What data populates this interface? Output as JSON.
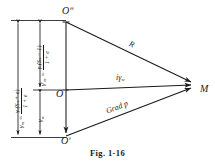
{
  "figure": {
    "caption": "Fig. 1-16",
    "type": "vector-force-diagram"
  },
  "points": [
    {
      "name": "O-double-prime",
      "label": "Oʺ",
      "x": 66,
      "y": 22
    },
    {
      "name": "O-origin",
      "label": "O",
      "x": 66,
      "y": 90
    },
    {
      "name": "O-prime",
      "label": "Oʹ",
      "x": 66,
      "y": 136
    },
    {
      "name": "M-point",
      "label": "M",
      "x": 197,
      "y": 85
    }
  ],
  "vectors": [
    {
      "name": "R-vector",
      "label": "R",
      "from": "Oʺ",
      "to": "M"
    },
    {
      "name": "igw-vector",
      "label": "iγ",
      "sub": "w",
      "from": "O",
      "to": "M"
    },
    {
      "name": "gradp-vector",
      "label": "Grad p",
      "from": "Oʹ",
      "to": "M"
    }
  ],
  "dimensions": [
    {
      "name": "gamma-m-dimension",
      "lhs": "γ",
      "lhs_sub": "m",
      "equals": "=",
      "numerator": "γₐ(Sₛ + e)",
      "denominator": "1 + e",
      "numerator_plain": "γw(Ss + e)",
      "denominator_plain": "1 + e",
      "spans": "Oʺ to Oʹ"
    },
    {
      "name": "gamma-m-prime-dimension",
      "lhs": "γʹ",
      "lhs_sub": "m",
      "equals": "=",
      "numerator": "γₐ(Sₛ − 1)",
      "denominator": "1 + e",
      "numerator_plain": "γw(Ss - 1)",
      "denominator_plain": "1 + e",
      "spans": "Oʺ to O"
    },
    {
      "name": "gamma-w-dimension",
      "lhs": "γ",
      "lhs_sub": "w",
      "equals": "",
      "numerator": "",
      "denominator": "",
      "spans": "O to Oʹ"
    }
  ],
  "symbols": {
    "gamma": "γ",
    "prime": "ʹ",
    "double_prime": "ʺ",
    "sub_m": "m",
    "sub_w": "w",
    "sub_s": "s"
  },
  "colors": {
    "ink": "#1a1a1a",
    "stroke": "#1a1a1a",
    "background": "#ffffff"
  }
}
